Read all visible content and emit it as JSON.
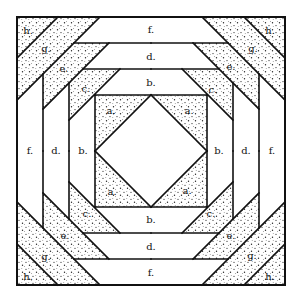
{
  "diagram": {
    "title": "",
    "type": "quilt block piecing diagram",
    "colors": {
      "line": "#111111",
      "background": "#ffffff",
      "shade_dots": "#222222"
    },
    "pieces": {
      "a": {
        "label": "a.",
        "count": 4,
        "shaded": true
      },
      "b": {
        "label": "b.",
        "count": 4,
        "shaded": false
      },
      "c": {
        "label": "c.",
        "count": 4,
        "shaded": true
      },
      "d": {
        "label": "d.",
        "count": 4,
        "shaded": false
      },
      "e": {
        "label": "e.",
        "count": 4,
        "shaded": true
      },
      "f": {
        "label": "f.",
        "count": 4,
        "shaded": false
      },
      "g": {
        "label": "g.",
        "count": 4,
        "shaded": true
      },
      "h": {
        "label": "h.",
        "count": 4,
        "shaded": true
      }
    },
    "labels": {
      "top": {
        "f": "f.",
        "d": "d.",
        "b": "b."
      },
      "bottom": {
        "f": "f.",
        "d": "d.",
        "b": "b."
      },
      "left": {
        "f": "f.",
        "d": "d.",
        "b": "b."
      },
      "right": {
        "f": "f.",
        "d": "d.",
        "b": "b."
      },
      "corner_tl": {
        "h": "h.",
        "g": "g.",
        "e": "e.",
        "c": "c.",
        "a": "a."
      },
      "corner_tr": {
        "h": "h.",
        "g": "g.",
        "e": "e.",
        "c": "c.",
        "a": "a."
      },
      "corner_bl": {
        "h": "h.",
        "g": "g.",
        "e": "e.",
        "c": "c.",
        "a": "a."
      },
      "corner_br": {
        "h": "h.",
        "g": "g.",
        "e": "e.",
        "c": "c.",
        "a": "a."
      }
    }
  }
}
